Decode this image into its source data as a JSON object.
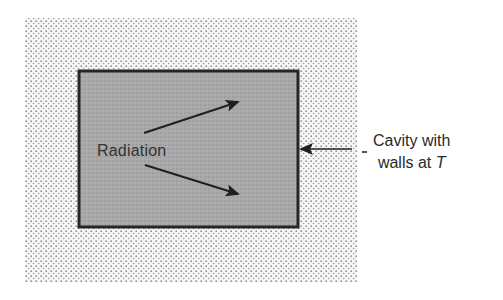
{
  "diagram": {
    "type": "physics-schematic",
    "outer_region": {
      "fill": "stippled",
      "dot_color": "#8a8a8a",
      "background": "#f4f4f4"
    },
    "cavity": {
      "fill": "#a9a9a9",
      "border_color": "#262626"
    },
    "labels": {
      "radiation": "Radiation",
      "cavity_line1": "Cavity with",
      "cavity_line2_prefix": "walls at ",
      "cavity_line2_var": "T"
    },
    "arrows": [
      {
        "name": "radiation-arrow-upper",
        "from": [
          144,
          133
        ],
        "to": [
          240,
          101
        ]
      },
      {
        "name": "radiation-arrow-lower",
        "from": [
          145,
          165
        ],
        "to": [
          240,
          195
        ]
      },
      {
        "name": "pointer-arrow-cavity-wall",
        "from": [
          352,
          149
        ],
        "to": [
          299,
          149
        ]
      }
    ],
    "colors": {
      "ink": "#262626",
      "text": "#2a2a2a"
    }
  }
}
